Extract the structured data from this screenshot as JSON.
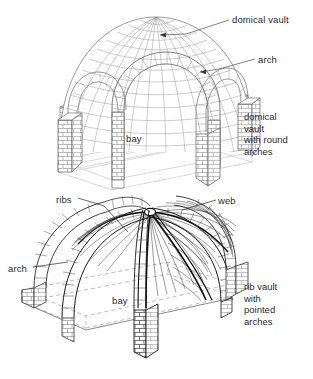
{
  "figure": {
    "background": "#ffffff",
    "ink": "#2b2b2b",
    "line_gray": "#8a8a8a",
    "line_light": "#c8c8c8",
    "line_dark": "#111111"
  },
  "top_diagram": {
    "name": "domical-vault-with-round-arches",
    "labels": {
      "domical_vault": "domical vault",
      "arch": "arch",
      "bay": "bay"
    },
    "caption_lines": [
      "domical",
      "vault",
      "with round",
      "arches"
    ]
  },
  "bottom_diagram": {
    "name": "rib-vault-with-pointed-arches",
    "labels": {
      "ribs": "ribs",
      "web": "web",
      "arch": "arch",
      "bay": "bay"
    },
    "caption_lines": [
      "rib vault",
      "with",
      "pointed",
      "arches"
    ]
  }
}
